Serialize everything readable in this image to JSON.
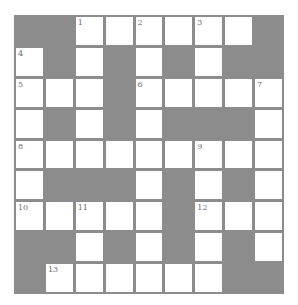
{
  "puzzle": {
    "type": "crossword",
    "rows": 9,
    "cols": 9,
    "colors": {
      "block": "#8c8c8c",
      "cell": "#ffffff",
      "grid_line": "#8c8c8c",
      "number": "#6e6e6e"
    },
    "grid": [
      [
        "#",
        "#",
        "1",
        ".",
        "2",
        ".",
        "3",
        ".",
        "#"
      ],
      [
        "4",
        "#",
        ".",
        "#",
        ".",
        "#",
        ".",
        "#",
        "#"
      ],
      [
        "5",
        ".",
        ".",
        "#",
        "6",
        ".",
        ".",
        ".",
        "7"
      ],
      [
        ".",
        "#",
        ".",
        "#",
        ".",
        "#",
        "#",
        "#",
        "."
      ],
      [
        "8",
        ".",
        ".",
        ".",
        ".",
        ".",
        "9",
        ".",
        "."
      ],
      [
        ".",
        "#",
        "#",
        "#",
        ".",
        "#",
        ".",
        "#",
        "."
      ],
      [
        "10",
        ".",
        "11",
        ".",
        ".",
        "#",
        "12",
        ".",
        "."
      ],
      [
        "#",
        "#",
        ".",
        "#",
        ".",
        "#",
        ".",
        "#",
        "."
      ],
      [
        "#",
        "13",
        ".",
        ".",
        ".",
        ".",
        ".",
        "#",
        "#"
      ]
    ],
    "numbers": [
      "1",
      "2",
      "3",
      "4",
      "5",
      "6",
      "7",
      "8",
      "9",
      "10",
      "11",
      "12",
      "13"
    ]
  }
}
